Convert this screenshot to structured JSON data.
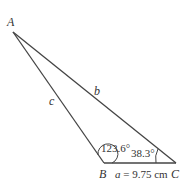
{
  "diagram": {
    "type": "triangle",
    "vertices": {
      "A": {
        "label": "A"
      },
      "B": {
        "label": "B"
      },
      "C": {
        "label": "C"
      }
    },
    "sides": {
      "a": {
        "label_var": "a",
        "label_rest": " = 9.75 cm"
      },
      "b": {
        "label": "b"
      },
      "c": {
        "label": "c"
      }
    },
    "angles": {
      "B": {
        "label": "123.6°"
      },
      "C": {
        "label": "38.3°"
      }
    },
    "colors": {
      "line": "#444444",
      "text": "#333333"
    }
  }
}
